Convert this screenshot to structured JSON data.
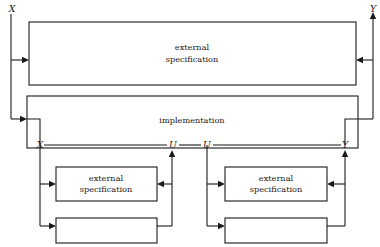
{
  "diagram": {
    "colors": {
      "stroke": "#1a1a1a",
      "background": "#ffffff"
    },
    "signals": {
      "input_top": "X",
      "output_top": "Y",
      "input_impl": "X",
      "internal_left": "U",
      "internal_right": "U",
      "output_impl": "Y"
    },
    "boxes": {
      "top_spec": {
        "line1": "external",
        "line2": "specification"
      },
      "implementation": {
        "label": "implementation"
      },
      "left_spec": {
        "line1": "external",
        "line2": "specification"
      },
      "right_spec": {
        "line1": "external",
        "line2": "specification"
      },
      "left_blank": {
        "label": ""
      },
      "right_blank": {
        "label": ""
      }
    }
  }
}
